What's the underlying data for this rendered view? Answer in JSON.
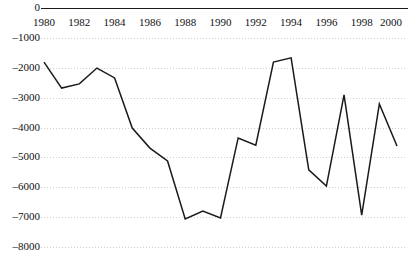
{
  "chart_data": {
    "type": "line",
    "title": "",
    "subtitle": "",
    "xlabel": "",
    "ylabel": "",
    "x": [
      1980,
      1981,
      1982,
      1983,
      1984,
      1985,
      1986,
      1987,
      1988,
      1989,
      1990,
      1991,
      1992,
      1993,
      1994,
      1995,
      1996,
      1997,
      1998,
      1999,
      2000
    ],
    "values": [
      -1810,
      -2680,
      -2540,
      -2010,
      -2340,
      -4020,
      -4690,
      -5120,
      -7060,
      -6800,
      -7030,
      -4350,
      -4590,
      -1810,
      -1670,
      -5420,
      -5960,
      -2910,
      -6930,
      -3210,
      -4620
    ],
    "series": [
      {
        "name": "",
        "color": "#1a1a1a",
        "values": [
          -1810,
          -2680,
          -2540,
          -2010,
          -2340,
          -4020,
          -4690,
          -5120,
          -7060,
          -6800,
          -7030,
          -4350,
          -4590,
          -1810,
          -1670,
          -5420,
          -5960,
          -2910,
          -6930,
          -3210,
          -4620
        ]
      }
    ],
    "xlim": [
      1979.7,
      2000.4
    ],
    "ylim": [
      -8000,
      0
    ],
    "xtick_labels": [
      "1980",
      "1982",
      "1984",
      "1986",
      "1988",
      "1990",
      "1992",
      "1994",
      "1996",
      "1998",
      "2000"
    ],
    "xtick_values": [
      1980,
      1982,
      1984,
      1986,
      1988,
      1990,
      1992,
      1994,
      1996,
      1998,
      2000
    ],
    "ytick_labels": [
      "0",
      "–1000",
      "–2000",
      "–3000",
      "–4000",
      "–5000",
      "–6000",
      "–7000",
      "–8000"
    ],
    "ytick_values": [
      0,
      -1000,
      -2000,
      -3000,
      -4000,
      -5000,
      -6000,
      -7000,
      -8000
    ],
    "grid": true,
    "grid_style": "dotted",
    "grid_color": "#cfcfcf",
    "axis_color": "#1a1a1a",
    "legend": false,
    "legend_position": "none",
    "annotations": []
  },
  "axes": {
    "top_axis_line_label": "zero-axis-line",
    "x_axis_position": "top"
  }
}
